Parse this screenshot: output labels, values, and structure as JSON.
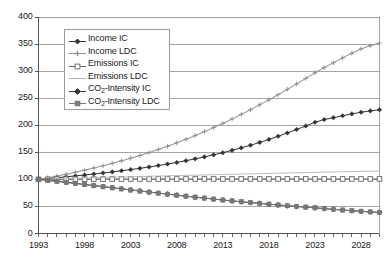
{
  "chart_data": {
    "type": "line",
    "title": "",
    "xlabel": "",
    "ylabel": "",
    "xlim": [
      1993,
      2030
    ],
    "ylim": [
      0,
      400
    ],
    "ytick_step": 50,
    "yticks": [
      "0",
      "50",
      "100",
      "150",
      "200",
      "250",
      "300",
      "350",
      "400"
    ],
    "xticks": [
      "1993",
      "1998",
      "2003",
      "2008",
      "2013",
      "2018",
      "2023",
      "2028"
    ],
    "xtick_minor_step": 1,
    "grid": "horizontal",
    "legend_position": "upper-left-inside",
    "x": [
      1993,
      1994,
      1995,
      1996,
      1997,
      1998,
      1999,
      2000,
      2001,
      2002,
      2003,
      2004,
      2005,
      2006,
      2007,
      2008,
      2009,
      2010,
      2011,
      2012,
      2013,
      2014,
      2015,
      2016,
      2017,
      2018,
      2019,
      2020,
      2021,
      2022,
      2023,
      2024,
      2025,
      2026,
      2027,
      2028,
      2029,
      2030
    ],
    "series": [
      {
        "name": "Income IC",
        "marker": "small-filled-diamond",
        "color": "#333333",
        "values": [
          100,
          101.5,
          103.1,
          104.7,
          106.4,
          108.1,
          109.9,
          111.8,
          113.8,
          115.9,
          118.1,
          120.4,
          122.9,
          125.5,
          128.3,
          131.3,
          134.5,
          137.9,
          141.5,
          145.3,
          149.3,
          153.6,
          158.2,
          163.1,
          168.3,
          173.8,
          179.6,
          185.7,
          192.1,
          198.7,
          205.5,
          210.5,
          214.0,
          217.5,
          221.0,
          224.0,
          226.5,
          228.5
        ]
      },
      {
        "name": "Income LDC",
        "marker": "small-plus",
        "color": "#8c8c8c",
        "values": [
          100,
          103.0,
          106.2,
          109.6,
          113.2,
          117.0,
          121.0,
          125.2,
          129.6,
          134.2,
          139.0,
          144.1,
          149.5,
          155.2,
          161.2,
          167.5,
          174.1,
          181.0,
          188.2,
          195.7,
          203.5,
          211.6,
          220.0,
          228.7,
          237.7,
          247.0,
          256.5,
          266.3,
          276.3,
          286.5,
          296.8,
          306.5,
          315.5,
          324.5,
          333.0,
          341.0,
          347.0,
          352.0
        ]
      },
      {
        "name": "Emissions IC",
        "marker": "open-square",
        "color": "#666666",
        "values": [
          100,
          100.1,
          100.2,
          100.3,
          100.4,
          100.4,
          100.5,
          100.5,
          100.6,
          100.6,
          100.6,
          100.7,
          100.7,
          100.7,
          100.7,
          100.7,
          100.8,
          100.8,
          100.8,
          100.8,
          100.8,
          100.8,
          100.8,
          100.8,
          100.8,
          100.8,
          100.8,
          100.8,
          100.8,
          100.8,
          100.8,
          100.8,
          100.8,
          100.8,
          100.8,
          100.8,
          100.8,
          100.8
        ]
      },
      {
        "name": "Emissions LDC",
        "marker": "none",
        "color": "#b3b3b3",
        "values": [
          100,
          100.5,
          101.0,
          101.5,
          102.0,
          102.5,
          103.0,
          103.5,
          104.0,
          104.4,
          104.9,
          105.3,
          105.8,
          106.2,
          106.6,
          107.0,
          107.4,
          107.8,
          108.2,
          108.6,
          109.0,
          109.4,
          109.8,
          110.2,
          110.6,
          111.0,
          111.4,
          111.8,
          112.2,
          112.6,
          113.0,
          113.4,
          113.8,
          114.1,
          114.4,
          114.7,
          115.0,
          115.3
        ]
      },
      {
        "name": "CO2-Intensity IC",
        "marker": "filled-diamond",
        "color": "#3a3a3a",
        "values": [
          100,
          98.3,
          96.5,
          94.6,
          92.7,
          90.7,
          88.7,
          86.7,
          84.7,
          82.7,
          80.7,
          78.7,
          76.7,
          74.7,
          72.8,
          70.9,
          69.0,
          67.2,
          65.4,
          63.6,
          61.9,
          60.2,
          58.6,
          57.0,
          55.5,
          54.0,
          52.6,
          51.2,
          49.9,
          48.6,
          47.4,
          46.0,
          44.6,
          43.3,
          42.0,
          40.9,
          39.8,
          38.8
        ]
      },
      {
        "name": "CO2-Intensity LDC",
        "marker": "filled-square",
        "color": "#777777",
        "values": [
          100,
          98.0,
          96.1,
          94.2,
          92.3,
          90.3,
          88.3,
          86.3,
          84.3,
          82.3,
          80.3,
          78.3,
          76.4,
          74.5,
          72.6,
          70.7,
          68.9,
          67.1,
          65.3,
          63.6,
          61.9,
          60.3,
          58.7,
          57.2,
          55.7,
          54.2,
          52.8,
          51.4,
          50.1,
          48.8,
          47.5,
          46.1,
          44.7,
          43.4,
          42.1,
          41.0,
          39.9,
          38.9
        ]
      }
    ]
  },
  "legend": {
    "items": [
      {
        "label_pre": "Income IC",
        "label_sub": "",
        "label_post": ""
      },
      {
        "label_pre": "Income LDC",
        "label_sub": "",
        "label_post": ""
      },
      {
        "label_pre": "Emissions IC",
        "label_sub": "",
        "label_post": ""
      },
      {
        "label_pre": "Emissions LDC",
        "label_sub": "",
        "label_post": ""
      },
      {
        "label_pre": "CO",
        "label_sub": "2",
        "label_post": "-Intensity IC"
      },
      {
        "label_pre": "CO",
        "label_sub": "2",
        "label_post": "-Intensity LDC"
      }
    ]
  },
  "colors": {
    "axis": "#555555",
    "grid": "#8e8e8e",
    "frame": "#9a9a9a",
    "text": "#1a1a1a",
    "background": "#ffffff"
  }
}
